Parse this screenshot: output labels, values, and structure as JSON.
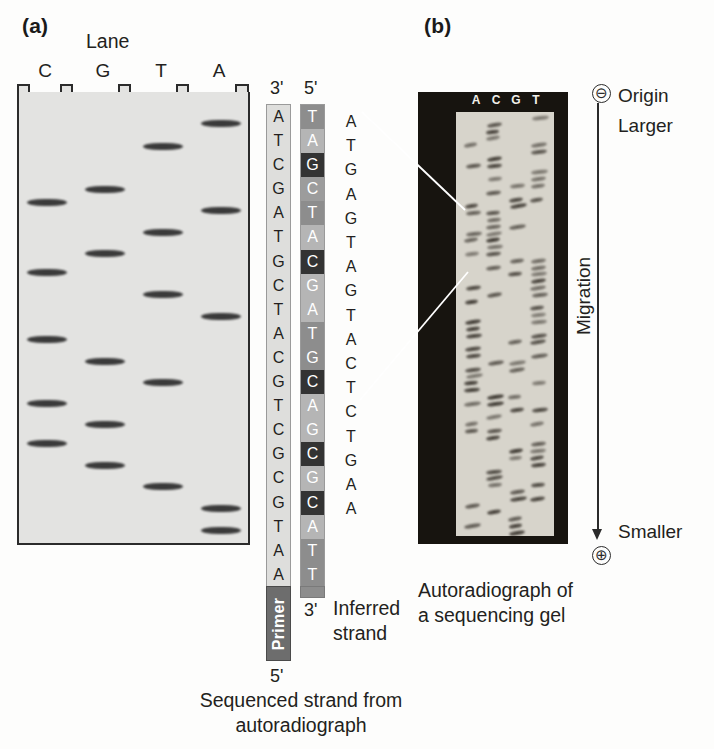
{
  "panel_a": {
    "letter": "(a)",
    "lane_title": "Lane",
    "lane_labels": [
      "C",
      "G",
      "T",
      "A"
    ],
    "bands": [
      {
        "lane": "A",
        "y": 120
      },
      {
        "lane": "T",
        "y": 143
      },
      {
        "lane": "C",
        "y": 199
      },
      {
        "lane": "G",
        "y": 186
      },
      {
        "lane": "A",
        "y": 207
      },
      {
        "lane": "T",
        "y": 229
      },
      {
        "lane": "G",
        "y": 250
      },
      {
        "lane": "C",
        "y": 269
      },
      {
        "lane": "T",
        "y": 291
      },
      {
        "lane": "A",
        "y": 313
      },
      {
        "lane": "C",
        "y": 336
      },
      {
        "lane": "G",
        "y": 358
      },
      {
        "lane": "T",
        "y": 379
      },
      {
        "lane": "C",
        "y": 400
      },
      {
        "lane": "G",
        "y": 421
      },
      {
        "lane": "C",
        "y": 440
      },
      {
        "lane": "G",
        "y": 462
      },
      {
        "lane": "T",
        "y": 483
      },
      {
        "lane": "A",
        "y": 505
      },
      {
        "lane": "A",
        "y": 527
      }
    ],
    "sequenced_strand": {
      "label_top": "3'",
      "label_bottom": "5'",
      "bases": [
        "A",
        "T",
        "C",
        "G",
        "A",
        "T",
        "G",
        "C",
        "T",
        "A",
        "C",
        "G",
        "T",
        "C",
        "G",
        "C",
        "G",
        "T",
        "A",
        "A"
      ]
    },
    "inferred_strand": {
      "label_top": "5'",
      "label_bottom": "3'",
      "caption": "Inferred strand",
      "bases": [
        {
          "base": "T",
          "shade": "#8d8d8d"
        },
        {
          "base": "A",
          "shade": "#b5b5b5"
        },
        {
          "base": "G",
          "shade": "#333333"
        },
        {
          "base": "C",
          "shade": "#9c9c9c"
        },
        {
          "base": "T",
          "shade": "#8d8d8d"
        },
        {
          "base": "A",
          "shade": "#b5b5b5"
        },
        {
          "base": "C",
          "shade": "#333333"
        },
        {
          "base": "G",
          "shade": "#b5b5b5"
        },
        {
          "base": "A",
          "shade": "#b5b5b5"
        },
        {
          "base": "T",
          "shade": "#8d8d8d"
        },
        {
          "base": "G",
          "shade": "#8d8d8d"
        },
        {
          "base": "C",
          "shade": "#333333"
        },
        {
          "base": "A",
          "shade": "#b5b5b5"
        },
        {
          "base": "G",
          "shade": "#b5b5b5"
        },
        {
          "base": "C",
          "shade": "#333333"
        },
        {
          "base": "G",
          "shade": "#b5b5b5"
        },
        {
          "base": "C",
          "shade": "#333333"
        },
        {
          "base": "A",
          "shade": "#b5b5b5"
        },
        {
          "base": "T",
          "shade": "#8d8d8d"
        },
        {
          "base": "T",
          "shade": "#8d8d8d"
        }
      ]
    },
    "primer": {
      "label": "Primer",
      "label_below": "5'"
    },
    "caption": "Sequenced strand from autoradiograph"
  },
  "panel_b": {
    "letter": "(b)",
    "lane_labels": [
      "A",
      "C",
      "G",
      "T"
    ],
    "read_sequence": [
      "A",
      "T",
      "G",
      "A",
      "G",
      "T",
      "A",
      "G",
      "T",
      "A",
      "C",
      "T",
      "C",
      "T",
      "G",
      "A",
      "A"
    ],
    "origin_label": "Origin",
    "origin_symbol": "⊖",
    "larger_label": "Larger",
    "smaller_label": "Smaller",
    "positive_symbol": "⊕",
    "migration_label": "Migration",
    "caption": "Autoradiograph of a sequencing gel"
  }
}
